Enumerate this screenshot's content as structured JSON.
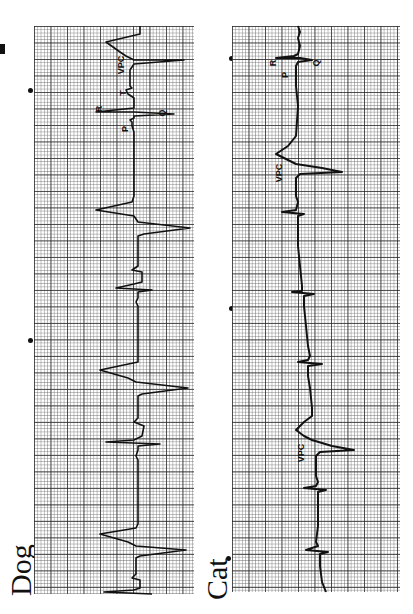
{
  "figure": {
    "orientation": "rotated 90° counter-clockwise",
    "panels": [
      {
        "id": "dog",
        "label": "Dog",
        "annotations": [
          "VPC",
          "R",
          "T",
          "P",
          "Q"
        ],
        "rhythm": "sinus complexes interrupted by ventricular premature complexes (VPC)"
      },
      {
        "id": "cat",
        "label": "Cat",
        "annotations": [
          "VPC",
          "R",
          "P",
          "Q",
          "VPC"
        ],
        "rhythm": "sinus complexes with two ventricular premature complexes (VPC)"
      }
    ]
  },
  "labels": {
    "dog": "Dog",
    "cat": "Cat",
    "vpc": "VPC",
    "r": "R",
    "t": "T",
    "p": "P",
    "q": "Q"
  },
  "colors": {
    "paper": "#ffffff",
    "grid_major": "#282828",
    "grid_minor": "#5a5a5a",
    "trace": "#111111"
  }
}
